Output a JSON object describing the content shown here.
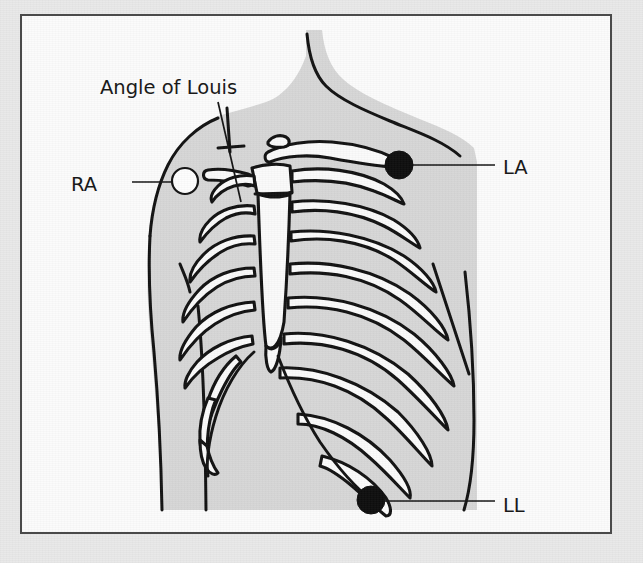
{
  "figure": {
    "kind": "anatomical-diagram",
    "frame": {
      "border_color": "#4a4a4a",
      "paper_color": "#fbfbfb",
      "mount_color": "#e9e9e9"
    },
    "palette": {
      "ink": "#111111",
      "skin_fill": "#d6d6d6",
      "bone_fill": "#fafafa",
      "electrode_dark": "#0d0d0d",
      "electrode_light": "#fdfdfd"
    }
  },
  "annotations": {
    "title_label": "Angle of Louis",
    "electrodes": [
      {
        "code": "RA",
        "name": "right-arm-electrode",
        "fill": "light",
        "label_side": "left",
        "label_x": 75,
        "label_y": 175,
        "dot_x": 163,
        "dot_y": 165,
        "dot_r": 13,
        "leader": "M 110 166 L 150 166"
      },
      {
        "code": "LA",
        "name": "left-arm-electrode",
        "fill": "dark",
        "label_side": "right",
        "label_x": 481,
        "label_y": 158,
        "dot_x": 377,
        "dot_y": 149,
        "dot_r": 14,
        "leader": "M 390 149 L 473 149"
      },
      {
        "code": "LL",
        "name": "left-leg-electrode",
        "fill": "dark",
        "label_side": "right",
        "label_x": 481,
        "label_y": 496,
        "dot_x": 349,
        "dot_y": 484,
        "dot_r": 14,
        "leader": "M 362 485 L 473 485"
      }
    ],
    "angle_of_louis": {
      "label_x": 78,
      "label_y": 78,
      "leader": "M 196 86 L 219 186"
    }
  }
}
